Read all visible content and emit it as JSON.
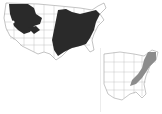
{
  "maps": [
    {
      "id": "main",
      "region": "Contiguous United States",
      "shading_color": "#2a2a2a",
      "outline_color": "#9a9a9a",
      "shaded_areas": [
        "Pacific Northwest / Northern Rockies",
        "Eastern United States"
      ]
    },
    {
      "id": "inset",
      "region": "Eastern United States",
      "shading_color": "#8c8c8c",
      "outline_color": "#a0a0a0",
      "shaded_areas": [
        "Northeast / Appalachians"
      ]
    }
  ]
}
